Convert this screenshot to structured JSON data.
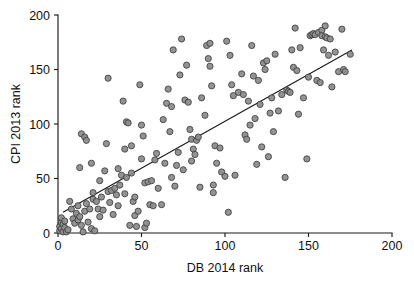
{
  "chart_data": {
    "type": "scatter",
    "title": "",
    "xlabel": "DB 2014 rank",
    "ylabel": "CPI 2013 rank",
    "xlim": [
      0,
      200
    ],
    "ylim": [
      0,
      200
    ],
    "xticks": [
      0,
      50,
      100,
      150,
      200
    ],
    "yticks": [
      0,
      50,
      100,
      150,
      200
    ],
    "xticklabels": [
      "0",
      "50",
      "100",
      "150",
      "200"
    ],
    "yticklabels": [
      "0",
      "50",
      "100",
      "150",
      "200"
    ],
    "grid": false,
    "legend": null,
    "marker": {
      "shape": "circle",
      "fill_color": "#8d8d8d",
      "edge_color": "#3d3d3d",
      "radius_px": 3.1
    },
    "trendline": {
      "type": "linear-fit",
      "color": "#1b1b1b",
      "x_start": 3,
      "y_start": 19,
      "x_end": 176,
      "y_end": 168
    },
    "points": [
      [
        1,
        2
      ],
      [
        1,
        6
      ],
      [
        2,
        10
      ],
      [
        2,
        4
      ],
      [
        2,
        14
      ],
      [
        3,
        8
      ],
      [
        3,
        1
      ],
      [
        4,
        5
      ],
      [
        4,
        11
      ],
      [
        5,
        1
      ],
      [
        6,
        3
      ],
      [
        7,
        29
      ],
      [
        8,
        22
      ],
      [
        9,
        13
      ],
      [
        10,
        9
      ],
      [
        11,
        18
      ],
      [
        12,
        25
      ],
      [
        12,
        12
      ],
      [
        13,
        60
      ],
      [
        13,
        15
      ],
      [
        14,
        91
      ],
      [
        14,
        7
      ],
      [
        15,
        1
      ],
      [
        16,
        88
      ],
      [
        16,
        20
      ],
      [
        17,
        85
      ],
      [
        17,
        27
      ],
      [
        18,
        10
      ],
      [
        19,
        22
      ],
      [
        20,
        64
      ],
      [
        20,
        4
      ],
      [
        21,
        37
      ],
      [
        21,
        31
      ],
      [
        22,
        2
      ],
      [
        23,
        29
      ],
      [
        24,
        22
      ],
      [
        25,
        48
      ],
      [
        25,
        15
      ],
      [
        26,
        33
      ],
      [
        27,
        21
      ],
      [
        28,
        57
      ],
      [
        29,
        82
      ],
      [
        30,
        142
      ],
      [
        30,
        38
      ],
      [
        31,
        28
      ],
      [
        32,
        39
      ],
      [
        33,
        17
      ],
      [
        34,
        41
      ],
      [
        35,
        35
      ],
      [
        36,
        59
      ],
      [
        36,
        25
      ],
      [
        37,
        44
      ],
      [
        38,
        53
      ],
      [
        39,
        121
      ],
      [
        40,
        77
      ],
      [
        40,
        36
      ],
      [
        41,
        102
      ],
      [
        41,
        51
      ],
      [
        42,
        101
      ],
      [
        43,
        7
      ],
      [
        44,
        80
      ],
      [
        44,
        55
      ],
      [
        45,
        29
      ],
      [
        46,
        33
      ],
      [
        46,
        16
      ],
      [
        47,
        6
      ],
      [
        48,
        20
      ],
      [
        49,
        136
      ],
      [
        50,
        68
      ],
      [
        50,
        99
      ],
      [
        51,
        89
      ],
      [
        52,
        5
      ],
      [
        52,
        46
      ],
      [
        53,
        9
      ],
      [
        54,
        47
      ],
      [
        55,
        26
      ],
      [
        56,
        48
      ],
      [
        57,
        25
      ],
      [
        58,
        67
      ],
      [
        59,
        73
      ],
      [
        60,
        41
      ],
      [
        62,
        26
      ],
      [
        63,
        104
      ],
      [
        64,
        64
      ],
      [
        65,
        119
      ],
      [
        66,
        132
      ],
      [
        67,
        93
      ],
      [
        68,
        116
      ],
      [
        68,
        51
      ],
      [
        69,
        168
      ],
      [
        70,
        43
      ],
      [
        71,
        62
      ],
      [
        72,
        74
      ],
      [
        73,
        145
      ],
      [
        74,
        178
      ],
      [
        75,
        58
      ],
      [
        76,
        122
      ],
      [
        77,
        154
      ],
      [
        78,
        120
      ],
      [
        79,
        95
      ],
      [
        80,
        86
      ],
      [
        80,
        66
      ],
      [
        81,
        77
      ],
      [
        82,
        72
      ],
      [
        83,
        85
      ],
      [
        84,
        88
      ],
      [
        85,
        42
      ],
      [
        86,
        124
      ],
      [
        88,
        108
      ],
      [
        89,
        172
      ],
      [
        90,
        160
      ],
      [
        91,
        153
      ],
      [
        91,
        174
      ],
      [
        92,
        135
      ],
      [
        93,
        44
      ],
      [
        93,
        37
      ],
      [
        94,
        80
      ],
      [
        95,
        64
      ],
      [
        97,
        78
      ],
      [
        98,
        56
      ],
      [
        100,
        52
      ],
      [
        101,
        176
      ],
      [
        102,
        19
      ],
      [
        103,
        163
      ],
      [
        104,
        136
      ],
      [
        105,
        126
      ],
      [
        106,
        53
      ],
      [
        108,
        129
      ],
      [
        110,
        146
      ],
      [
        111,
        127
      ],
      [
        112,
        90
      ],
      [
        113,
        86
      ],
      [
        114,
        121
      ],
      [
        115,
        99
      ],
      [
        116,
        172
      ],
      [
        117,
        144
      ],
      [
        118,
        105
      ],
      [
        119,
        63
      ],
      [
        120,
        140
      ],
      [
        121,
        118
      ],
      [
        122,
        79
      ],
      [
        123,
        156
      ],
      [
        124,
        150
      ],
      [
        125,
        158
      ],
      [
        126,
        70
      ],
      [
        127,
        110
      ],
      [
        128,
        124
      ],
      [
        129,
        93
      ],
      [
        130,
        164
      ],
      [
        132,
        112
      ],
      [
        134,
        127
      ],
      [
        136,
        51
      ],
      [
        137,
        131
      ],
      [
        138,
        130
      ],
      [
        139,
        129
      ],
      [
        140,
        168
      ],
      [
        141,
        152
      ],
      [
        142,
        188
      ],
      [
        143,
        149
      ],
      [
        144,
        109
      ],
      [
        145,
        170
      ],
      [
        147,
        124
      ],
      [
        149,
        68
      ],
      [
        150,
        143
      ],
      [
        151,
        181
      ],
      [
        152,
        182
      ],
      [
        153,
        183
      ],
      [
        154,
        182
      ],
      [
        155,
        140
      ],
      [
        156,
        184
      ],
      [
        157,
        138
      ],
      [
        158,
        186
      ],
      [
        158,
        181
      ],
      [
        159,
        168
      ],
      [
        160,
        190
      ],
      [
        160,
        180
      ],
      [
        161,
        179
      ],
      [
        162,
        163
      ],
      [
        163,
        178
      ],
      [
        164,
        134
      ],
      [
        166,
        166
      ],
      [
        168,
        148
      ],
      [
        170,
        187
      ],
      [
        171,
        150
      ],
      [
        172,
        148
      ],
      [
        175,
        164
      ]
    ]
  }
}
